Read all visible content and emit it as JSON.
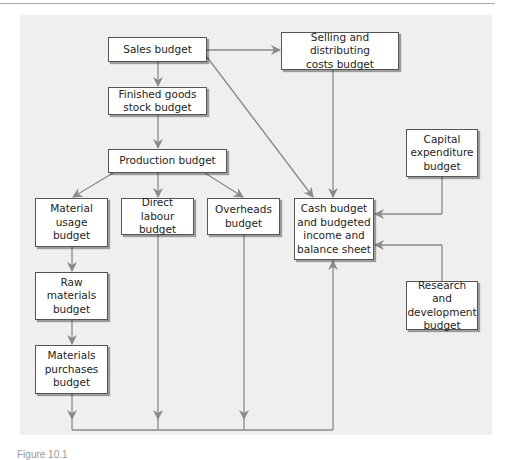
{
  "diagram": {
    "type": "budget-flowchart",
    "nodes": [
      {
        "id": "sales",
        "label": "Sales budget"
      },
      {
        "id": "selling",
        "label": "Selling and distributing\ncosts budget"
      },
      {
        "id": "finished",
        "label": "Finished goods\nstock budget"
      },
      {
        "id": "production",
        "label": "Production budget"
      },
      {
        "id": "material_usage",
        "label": "Material\nusage\nbudget"
      },
      {
        "id": "direct_labour",
        "label": "Direct labour\nbudget"
      },
      {
        "id": "overheads",
        "label": "Overheads\nbudget"
      },
      {
        "id": "cash",
        "label": "Cash budget\nand budgeted\nincome and\nbalance sheet"
      },
      {
        "id": "capital",
        "label": "Capital\nexpenditure\nbudget"
      },
      {
        "id": "research",
        "label": "Research and\ndevelopment\nbudget"
      },
      {
        "id": "raw_materials",
        "label": "Raw\nmaterials\nbudget"
      },
      {
        "id": "purchases",
        "label": "Materials\npurchases\nbudget"
      }
    ],
    "edges": [
      {
        "from": "sales",
        "to": "selling"
      },
      {
        "from": "sales",
        "to": "finished"
      },
      {
        "from": "sales",
        "to": "cash"
      },
      {
        "from": "selling",
        "to": "cash"
      },
      {
        "from": "finished",
        "to": "production"
      },
      {
        "from": "production",
        "to": "material_usage"
      },
      {
        "from": "production",
        "to": "direct_labour"
      },
      {
        "from": "production",
        "to": "overheads"
      },
      {
        "from": "material_usage",
        "to": "raw_materials"
      },
      {
        "from": "raw_materials",
        "to": "purchases"
      },
      {
        "from": "purchases",
        "to": "cash"
      },
      {
        "from": "direct_labour",
        "to": "cash"
      },
      {
        "from": "overheads",
        "to": "cash"
      },
      {
        "from": "capital",
        "to": "cash"
      },
      {
        "from": "research",
        "to": "cash"
      }
    ],
    "colors": {
      "panel": "#efefef",
      "line": "#8a8a8a",
      "box_border": "#555555"
    }
  },
  "caption": "Figure 10.1"
}
